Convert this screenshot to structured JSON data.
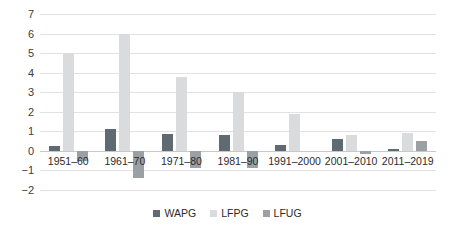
{
  "chart_data": {
    "type": "bar",
    "title": "",
    "subtitle": "",
    "xlabel": "",
    "ylabel": "",
    "categories": [
      "1951–60",
      "1961–70",
      "1971–80",
      "1981–90",
      "1991–2000",
      "2001–2010",
      "2011–2019"
    ],
    "series": [
      {
        "name": "WAPG",
        "color": "#5f6b72",
        "values": [
          0.25,
          1.1,
          0.85,
          0.8,
          0.3,
          0.6,
          0.08
        ]
      },
      {
        "name": "LFPG",
        "color": "#d9dbdc",
        "values": [
          5.0,
          6.0,
          3.8,
          3.0,
          1.9,
          0.8,
          0.9
        ]
      },
      {
        "name": "LFUG",
        "color": "#9aa0a4",
        "values": [
          -0.5,
          -1.4,
          -0.9,
          -0.9,
          0.0,
          -0.15,
          0.5
        ]
      }
    ],
    "ylim": [
      -2,
      7
    ],
    "yticks": [
      "7",
      "6",
      "5",
      "4",
      "3",
      "2",
      "1",
      "0",
      "−1",
      "−2"
    ],
    "ytick_values": [
      7,
      6,
      5,
      4,
      3,
      2,
      1,
      0,
      -1,
      -2
    ],
    "grid": true,
    "legend_position": "bottom"
  }
}
